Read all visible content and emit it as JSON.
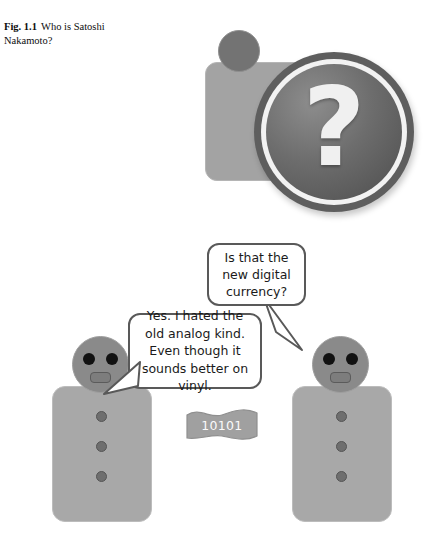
{
  "figure": {
    "caption_label": "Fig. 1.1",
    "caption_text": "Who is Satoshi Nakamoto?"
  },
  "unknown_person": {
    "icon_name": "person-with-question-mark",
    "question_glyph": "?",
    "colors": {
      "person_body": "#a3a3a3",
      "person_head": "#737373",
      "badge_ring": "#5e5e5e",
      "badge_disc": "#6d6d6d",
      "question_mark": "#f0f0f0"
    }
  },
  "bubbles": [
    {
      "id": "question",
      "speaker": "right-character",
      "text": "Is that the new digital currency?"
    },
    {
      "id": "answer",
      "speaker": "left-character",
      "text": "Yes. I hated the old analog kind. Even though it sounds better on vinyl."
    }
  ],
  "characters": [
    {
      "id": "left",
      "position": "left"
    },
    {
      "id": "right",
      "position": "right"
    }
  ],
  "banner": {
    "label": "10101",
    "fill_color": "#a0a0a0",
    "text_color": "#fafafa"
  }
}
